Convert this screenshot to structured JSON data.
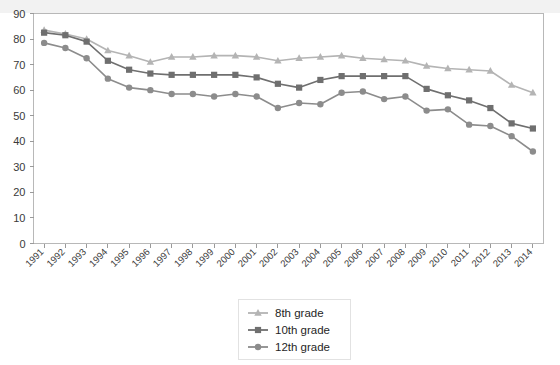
{
  "chart_data": {
    "type": "line",
    "title": "",
    "subtitle": "",
    "xlabel": "",
    "ylabel": "",
    "xlim": [
      1991,
      2014
    ],
    "ylim": [
      0,
      90
    ],
    "ytick_step": 10,
    "grid": false,
    "legend_position": "bottom-center",
    "categories": [
      "1991",
      "1992",
      "1993",
      "1994",
      "1995",
      "1996",
      "1997",
      "1998",
      "1999",
      "2000",
      "2001",
      "2002",
      "2003",
      "2004",
      "2005",
      "2006",
      "2007",
      "2008",
      "2009",
      "2010",
      "2011",
      "2012",
      "2013",
      "2014"
    ],
    "yticks": [
      "0",
      "10",
      "20",
      "30",
      "40",
      "50",
      "60",
      "70",
      "80",
      "90"
    ],
    "series": [
      {
        "name": "8th grade",
        "marker": "triangle",
        "color": "#b4b4b4",
        "values": [
          83.5,
          82.0,
          80.0,
          75.5,
          73.5,
          71.0,
          73.0,
          73.0,
          73.5,
          73.5,
          73.0,
          71.5,
          72.5,
          73.0,
          73.5,
          72.5,
          72.0,
          71.5,
          69.5,
          68.5,
          68.0,
          67.5,
          62.0,
          59.0
        ]
      },
      {
        "name": "10th grade",
        "marker": "square",
        "color": "#6f6f6f",
        "values": [
          82.5,
          81.5,
          79.0,
          71.5,
          68.0,
          66.5,
          66.0,
          66.0,
          66.0,
          66.0,
          65.0,
          62.5,
          61.0,
          64.0,
          65.5,
          65.5,
          65.5,
          65.5,
          60.5,
          58.0,
          56.0,
          53.0,
          47.0,
          45.0
        ]
      },
      {
        "name": "12th grade",
        "marker": "circle",
        "color": "#8c8c8c",
        "values": [
          78.5,
          76.5,
          72.5,
          64.5,
          61.0,
          60.0,
          58.5,
          58.5,
          57.5,
          58.5,
          57.5,
          53.0,
          55.0,
          54.5,
          59.0,
          59.5,
          56.5,
          57.5,
          52.0,
          52.5,
          46.5,
          46.0,
          42.0,
          36.0
        ]
      }
    ]
  },
  "legend": {
    "items": [
      {
        "label": "8th grade",
        "marker": "triangle",
        "color": "#b4b4b4"
      },
      {
        "label": "10th grade",
        "marker": "square",
        "color": "#6f6f6f"
      },
      {
        "label": "12th grade",
        "marker": "circle",
        "color": "#8c8c8c"
      }
    ]
  }
}
